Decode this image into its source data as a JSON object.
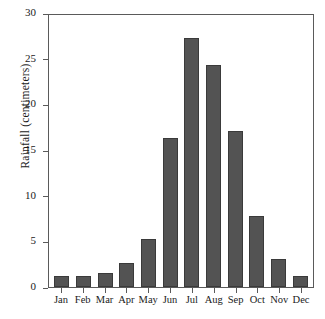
{
  "chart_data": {
    "type": "bar",
    "title": "",
    "xlabel": "",
    "ylabel": "Rainfall (centimeters)",
    "categories": [
      "Jan",
      "Feb",
      "Mar",
      "Apr",
      "May",
      "Jun",
      "Jul",
      "Aug",
      "Sep",
      "Oct",
      "Nov",
      "Dec"
    ],
    "values": [
      1.2,
      1.2,
      1.5,
      2.6,
      5.3,
      16.3,
      27.3,
      24.3,
      17.1,
      7.8,
      3.1,
      1.2
    ],
    "ylim": [
      0,
      30
    ],
    "yticks": [
      0,
      5,
      10,
      15,
      20,
      25,
      30
    ],
    "ytick_labels": [
      "0",
      "5",
      "10",
      "15",
      "20",
      "25",
      "30"
    ],
    "grid": false,
    "legend": null,
    "bar_color": "#535353",
    "bar_edge_color": "#3a3a3a",
    "axis_color": "#5a5a5a",
    "background": "#ffffff"
  }
}
